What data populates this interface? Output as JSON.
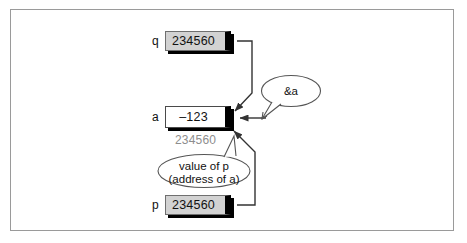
{
  "figure": {
    "frame": {
      "border_color": "#9a9a9a",
      "background": "#ffffff"
    }
  },
  "variables": [
    {
      "name": "q",
      "label": "q",
      "value": "234560",
      "kind": "pointer"
    },
    {
      "name": "a",
      "label": "a",
      "value": "–123",
      "kind": "value"
    },
    {
      "name": "p",
      "label": "p",
      "value": "234560",
      "kind": "pointer"
    }
  ],
  "boxes": {
    "q": {
      "label": "q",
      "value": "234560"
    },
    "a": {
      "label": "a",
      "value": "–123"
    },
    "p": {
      "label": "p",
      "value": "234560"
    }
  },
  "annotations": {
    "address_of_a": "234560",
    "address_color": "#8d8d8d"
  },
  "callouts": [
    {
      "name": "amp-a",
      "text": "&a",
      "points_to": "a"
    },
    {
      "name": "value-of-p",
      "line1": "value of p",
      "line2": "(address of a)",
      "points_to": "a"
    }
  ],
  "callout_amp": {
    "text": "&a"
  },
  "callout_valp": {
    "line1": "value of p",
    "line2": "(address of a)"
  },
  "colors": {
    "pointer_fill": "#d2d2d2",
    "value_fill": "#ffffff",
    "shadow": "#000000",
    "outline": "#6f6f6f",
    "arrow": "#333333",
    "muted_text": "#8d8d8d"
  }
}
